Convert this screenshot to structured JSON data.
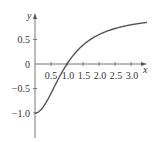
{
  "chart_data": {
    "type": "line",
    "title": "",
    "xlabel": "x",
    "ylabel": "y",
    "xlim": [
      0,
      3.5
    ],
    "ylim": [
      -1.5,
      1.0
    ],
    "grid": false,
    "legend": null,
    "x_ticks": [
      "0.5",
      "1.0",
      "1.5",
      "2.0",
      "2.5",
      "3.0"
    ],
    "y_ticks": [
      "0.5",
      "0",
      "−0.5",
      "−1.0"
    ],
    "series": [
      {
        "name": "curve",
        "color": "#555555",
        "x": [
          0,
          0.25,
          0.5,
          0.75,
          1.0,
          1.25,
          1.5,
          1.75,
          2.0,
          2.25,
          2.5,
          2.75,
          3.0,
          3.25,
          3.5
        ],
        "y": [
          -1.0,
          -0.88,
          -0.6,
          -0.28,
          0.0,
          0.22,
          0.38,
          0.51,
          0.6,
          0.67,
          0.72,
          0.77,
          0.8,
          0.83,
          0.85
        ]
      }
    ],
    "annotations": []
  },
  "axes": {
    "x_label": "x",
    "y_label": "y",
    "x_tick_labels": [
      "0.5",
      "1.0",
      "1.5",
      "2.0",
      "2.5",
      "3.0"
    ],
    "y_tick_labels": [
      "0.5",
      "0",
      "−0.5",
      "−1.0"
    ]
  }
}
